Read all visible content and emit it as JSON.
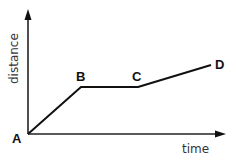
{
  "diagram": {
    "type": "distance-time graph",
    "axes": {
      "x_label": "time",
      "y_label": "distance"
    },
    "points": [
      {
        "label": "A",
        "x": 28,
        "y": 134
      },
      {
        "label": "B",
        "x": 81,
        "y": 87
      },
      {
        "label": "C",
        "x": 138,
        "y": 87
      },
      {
        "label": "D",
        "x": 211,
        "y": 65
      }
    ],
    "colors": {
      "line": "#111111",
      "axis": "#222222",
      "background": "#ffffff"
    }
  }
}
